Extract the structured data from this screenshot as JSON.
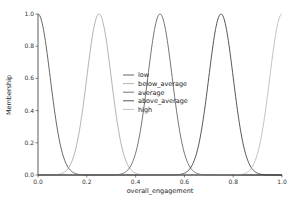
{
  "chart_data": {
    "type": "line",
    "title": "",
    "xlabel": "overall_engagement",
    "ylabel": "Membership",
    "xlim": [
      0.0,
      1.0
    ],
    "ylim": [
      0.0,
      1.0
    ],
    "xticks": [
      "0.0",
      "0.2",
      "0.4",
      "0.6",
      "0.8",
      "1.0"
    ],
    "yticks": [
      "0.0",
      "0.2",
      "0.4",
      "0.6",
      "0.8",
      "1.0"
    ],
    "grid": false,
    "legend_position": "center",
    "series": [
      {
        "name": "low",
        "shape": "gaussian",
        "mean": 0.0,
        "sigma": 0.05,
        "color": "#555555"
      },
      {
        "name": "below_average",
        "shape": "gaussian",
        "mean": 0.25,
        "sigma": 0.05,
        "color": "#aaaaaa"
      },
      {
        "name": "average",
        "shape": "gaussian",
        "mean": 0.5,
        "sigma": 0.05,
        "color": "#666666"
      },
      {
        "name": "above_average",
        "shape": "gaussian",
        "mean": 0.75,
        "sigma": 0.05,
        "color": "#444444"
      },
      {
        "name": "high",
        "shape": "gaussian",
        "mean": 1.0,
        "sigma": 0.05,
        "color": "#bbbbbb"
      }
    ]
  }
}
